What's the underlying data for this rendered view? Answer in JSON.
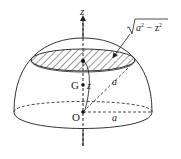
{
  "diagram": {
    "labels": {
      "axis": "z",
      "slice_radius_prefix": "a",
      "slice_radius_sup1": "2",
      "slice_radius_mid": " − z",
      "slice_radius_sup2": "2",
      "centroid": "G",
      "height": "z",
      "slant_radius": "a",
      "origin": "O",
      "base_radius": "a"
    },
    "colors": {
      "stroke": "#333333",
      "background": "#ffffff"
    }
  }
}
